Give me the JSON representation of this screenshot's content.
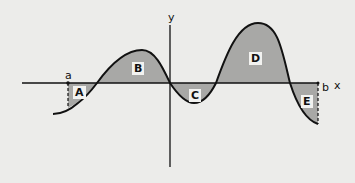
{
  "diagram": {
    "title": "",
    "axes": {
      "x_label": "x",
      "y_label": "y"
    },
    "bounds": {
      "lower": "a",
      "upper": "b"
    },
    "regions": [
      {
        "id": "A",
        "label": "A",
        "sign": "above",
        "note": "small region between a and first root"
      },
      {
        "id": "B",
        "label": "B",
        "sign": "above"
      },
      {
        "id": "C",
        "label": "C",
        "sign": "below"
      },
      {
        "id": "D",
        "label": "D",
        "sign": "above"
      },
      {
        "id": "E",
        "label": "E",
        "sign": "below",
        "note": "region between last root and b"
      }
    ],
    "colors": {
      "background": "#ececea",
      "fill": "#a8a8a6",
      "stroke": "#111111"
    }
  }
}
